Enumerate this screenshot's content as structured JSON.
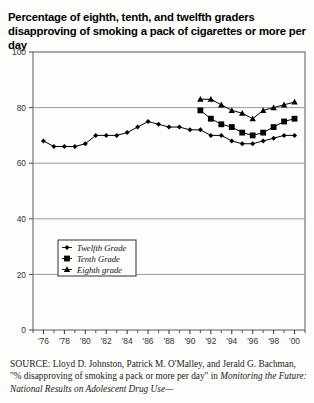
{
  "title": "Percentage of eighth, tenth, and twelfth graders disapproving of smoking a pack of cigarettes or more per day",
  "source": {
    "label": "SOURCE:",
    "text": " Lloyd D. Johnston, Patrick M. O'Malley, and Jerald G. Bachman, \"% disapproving of smoking a pack or more per day\" in ",
    "italic_text": "Monitoring the Future: National Results on Adolescent Drug Use—"
  },
  "legend": {
    "position": "inside-lower-left",
    "entries": [
      {
        "label": "Twelfth Grade",
        "marker": "diamond-marker"
      },
      {
        "label": "Tenth Grade",
        "marker": "square-marker"
      },
      {
        "label": "Eighth grade",
        "marker": "triangle-marker"
      }
    ]
  },
  "chart_data": {
    "type": "line",
    "title": "Percentage of eighth, tenth, and twelfth graders disapproving of smoking a pack of cigarettes or more per day",
    "xlabel": "Year",
    "ylabel": "",
    "xlim": [
      1975,
      2001
    ],
    "ylim": [
      0,
      100
    ],
    "grid": true,
    "ytick_labels": [
      "0",
      "20",
      "40",
      "60",
      "80",
      "100"
    ],
    "yticks": [
      0,
      20,
      40,
      60,
      80,
      100
    ],
    "xtick_labels": [
      "'76",
      "'78",
      "'80",
      "'82",
      "'84",
      "'86",
      "'88",
      "'90",
      "'92",
      "'94",
      "'96",
      "'98",
      "'00"
    ],
    "xticks": [
      1976,
      1978,
      1980,
      1982,
      1984,
      1986,
      1988,
      1990,
      1992,
      1994,
      1996,
      1998,
      2000
    ],
    "x_minor_ticks": [
      1975,
      1977,
      1979,
      1981,
      1983,
      1985,
      1987,
      1989,
      1991,
      1993,
      1995,
      1997,
      1999,
      2001
    ],
    "series": [
      {
        "name": "Twelfth Grade",
        "marker": "diamond",
        "x": [
          1976,
          1977,
          1978,
          1979,
          1980,
          1981,
          1982,
          1983,
          1984,
          1985,
          1986,
          1987,
          1988,
          1989,
          1990,
          1991,
          1992,
          1993,
          1994,
          1995,
          1996,
          1997,
          1998,
          1999,
          2000
        ],
        "values": [
          68,
          66,
          66,
          66,
          67,
          70,
          70,
          70,
          71,
          73,
          75,
          74,
          73,
          73,
          72,
          72,
          70,
          70,
          68,
          67,
          67,
          68,
          69,
          70,
          70
        ]
      },
      {
        "name": "Tenth Grade",
        "marker": "square",
        "x": [
          1991,
          1992,
          1993,
          1994,
          1995,
          1996,
          1997,
          1998,
          1999,
          2000
        ],
        "values": [
          79,
          76,
          74,
          73,
          71,
          70,
          71,
          73,
          75,
          76
        ]
      },
      {
        "name": "Eighth grade",
        "marker": "triangle",
        "x": [
          1991,
          1992,
          1993,
          1994,
          1995,
          1996,
          1997,
          1998,
          1999,
          2000
        ],
        "values": [
          83,
          83,
          81,
          79,
          78,
          76,
          79,
          80,
          81,
          82
        ]
      }
    ]
  }
}
